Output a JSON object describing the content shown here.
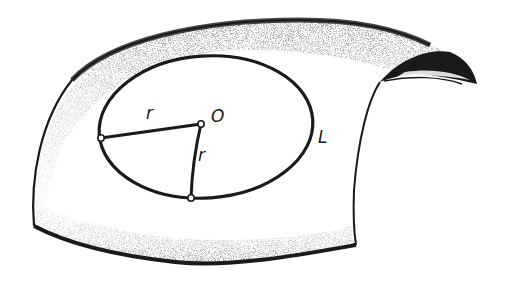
{
  "figure": {
    "colors": {
      "ink": "#1a1a1a",
      "paper": "#ffffff",
      "stipple": "#3a3a3a"
    },
    "labels": {
      "center": "O",
      "radius_top": "r",
      "radius_right": "r",
      "curve": "L"
    },
    "points": {
      "center": {
        "x": 201,
        "y": 124
      },
      "left_end": {
        "x": 101,
        "y": 138
      },
      "bottom_end": {
        "x": 191,
        "y": 198
      }
    }
  }
}
